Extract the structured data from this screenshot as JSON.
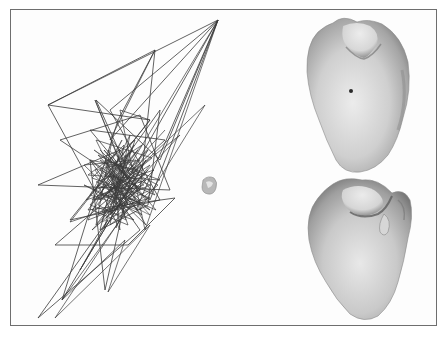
{
  "figure": {
    "caption_cut_off": "",
    "panels": [
      {
        "id": "scribble",
        "description": "dense polyline traversal (point sequence) forming a diagonal scribble"
      },
      {
        "id": "inset",
        "description": "small shaded mesh thumbnail"
      },
      {
        "id": "render_top",
        "description": "shaded 3D surface rendering with notch at top and dark marker point"
      },
      {
        "id": "render_bottom",
        "description": "shaded 3D surface rendering, second view with fold at top right"
      }
    ],
    "colors": {
      "frame": "#6e6e6e",
      "line": "#3a3a3a",
      "surface_light": "#e6e6e6",
      "surface_dark": "#7a7a7a",
      "marker": "#2a2a2a"
    }
  }
}
